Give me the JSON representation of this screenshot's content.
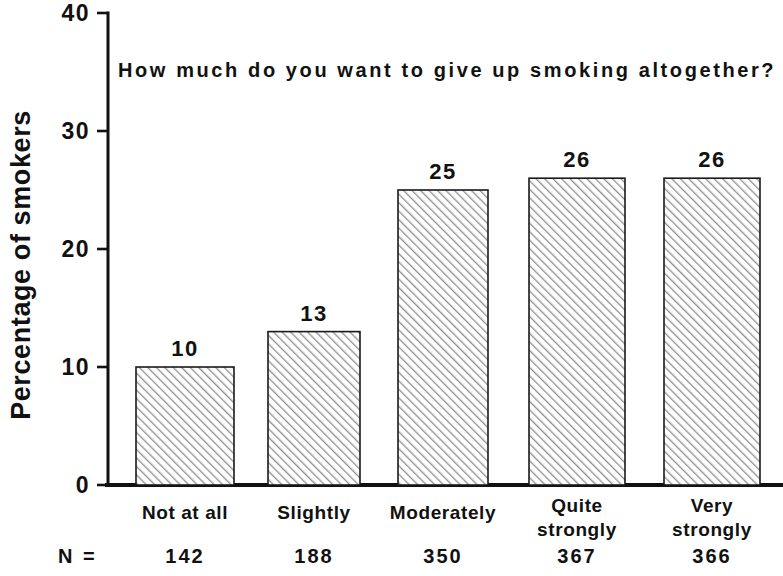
{
  "chart_data": {
    "type": "bar",
    "title": "How much do you want to give up smoking altogether?",
    "xlabel": "",
    "ylabel": "Percentage of smokers",
    "categories": [
      "Not at all",
      "Slightly",
      "Moderately",
      "Quite strongly",
      "Very strongly"
    ],
    "category_lines": [
      [
        "Not at all"
      ],
      [
        "Slightly"
      ],
      [
        "Moderately"
      ],
      [
        "Quite",
        "strongly"
      ],
      [
        "Very",
        "strongly"
      ]
    ],
    "values": [
      10,
      13,
      25,
      26,
      26
    ],
    "value_labels": [
      "10",
      "13",
      "25",
      "26",
      "26"
    ],
    "ylim": [
      0,
      40
    ],
    "yticks": [
      0,
      10,
      20,
      30,
      40
    ],
    "ytick_labels": [
      "0",
      "10",
      "20",
      "30",
      "40"
    ],
    "grid": false,
    "legend": null,
    "n_prefix": "N =",
    "n_values": [
      142,
      188,
      350,
      367,
      366
    ],
    "n_labels": [
      "142",
      "188",
      "350",
      "367",
      "366"
    ],
    "bar_fill": "#ffffff",
    "bar_hatch": "diagonal-forward",
    "bar_hatch_color": "#8a8a8a",
    "bar_edge_color": "#1a1a1a",
    "axis_color": "#111111",
    "background": "#ffffff"
  }
}
